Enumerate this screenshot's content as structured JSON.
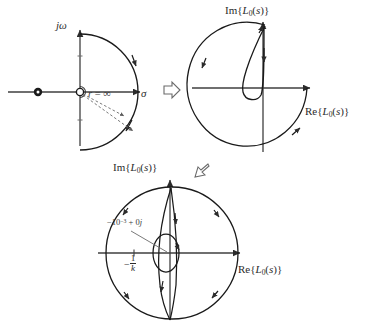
{
  "figure": {
    "panels": [
      {
        "id": "s-plane-contour",
        "name": "s-plane Nyquist D-contour",
        "axis_vertical_label": "jω",
        "axis_horizontal_label": "σ",
        "radius_label": "r = ∞",
        "markers": [
          {
            "name": "open-loop-pole",
            "style": "filled-dot",
            "position": "negative-real-axis"
          },
          {
            "name": "origin-indentation",
            "style": "open-circle",
            "position": "origin"
          }
        ]
      },
      {
        "id": "mapped-contour",
        "name": "image of contour under L0(s)",
        "axis_vertical_label": "Im{L0(s)}",
        "axis_horizontal_label": "Re{L0(s)}"
      },
      {
        "id": "mapped-contour-zoom",
        "name": "scaled view of image contour",
        "axis_vertical_label": "Im{L0(s)}",
        "axis_horizontal_label": "Re{L0(s)}",
        "annotations": [
          {
            "name": "critical-point",
            "text": "−10⁻³ + 0j"
          },
          {
            "name": "minus-one-over-k",
            "text": "−1/k"
          }
        ]
      }
    ],
    "transition_arrows": [
      {
        "name": "arrow-right-mapping",
        "glyph": "⇨",
        "direction": "right"
      },
      {
        "name": "arrow-left-mapping",
        "glyph": "⇦",
        "direction": "left-down"
      }
    ],
    "colors": {
      "curve": "#1a1a1a",
      "axis": "#3f3f3f",
      "annotation": "#3a3a3a",
      "dashed": "#6a6a6a",
      "background": "#ffffff"
    }
  }
}
